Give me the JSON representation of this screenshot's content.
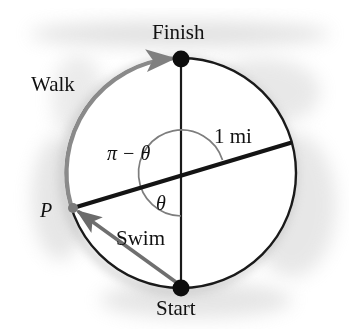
{
  "figure": {
    "title_alt": "Circle of radius 1 mi with swim chord and walk arc",
    "labels": {
      "finish": "Finish",
      "start": "Start",
      "walk": "Walk",
      "swim": "Swim",
      "radius": "1 mi",
      "point_p": "P",
      "angle_upper": "π − θ",
      "angle_lower": "θ"
    },
    "colors": {
      "ink": "#111111",
      "circle_stroke": "#1a1a1a",
      "walk_arrow": "#808080",
      "swim_arrow": "#6b6b6b",
      "arc_stroke": "#777777",
      "shadow": "#bdbdbd",
      "background": "#ffffff"
    },
    "geometry": {
      "center_x": 181,
      "center_y": 173,
      "radius": 115,
      "finish_point": [
        181,
        59
      ],
      "start_point": [
        181,
        288
      ],
      "p_point": [
        73,
        208
      ],
      "diameter_end": [
        290,
        143
      ],
      "diameter_angle_deg": 17,
      "dot_radius": 8
    }
  }
}
